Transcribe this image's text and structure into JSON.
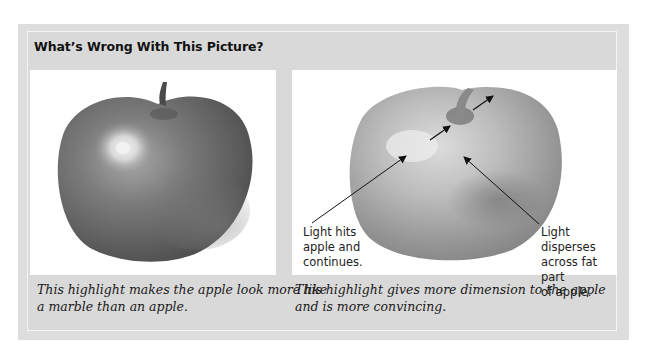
{
  "figure": {
    "title": "What’s Wrong With This Picture?",
    "left": {
      "image": "apple-with-marble-highlight",
      "caption": "This highlight makes the apple look more like\na marble than an apple."
    },
    "right": {
      "image": "apple-with-dispersed-highlight",
      "annotations": [
        {
          "text": "Light hits\napple and\ncontinues."
        },
        {
          "text": "Light disperses\nacross fat part\nof apple."
        }
      ],
      "caption": "This highlight gives more dimension to the apple\nand is more convincing."
    }
  },
  "colors": {
    "frame": "#dddddd",
    "panel": "#d9d9d9",
    "image_bg": "#ffffff",
    "text": "#111111"
  }
}
